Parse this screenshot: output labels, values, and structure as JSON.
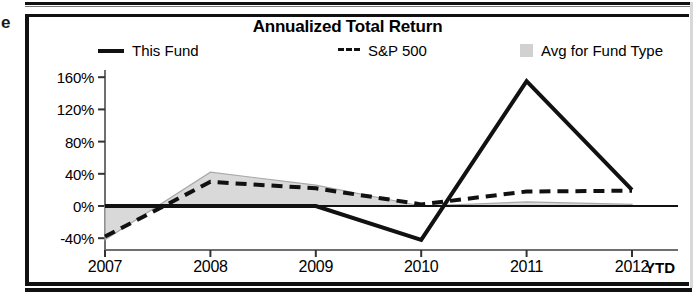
{
  "artifact": {
    "stray_glyph": "e"
  },
  "chart": {
    "title": "Annualized Total Return",
    "legend": [
      {
        "label": "This Fund",
        "marker": "solid-line-swatch",
        "color": "#111111"
      },
      {
        "label": "S&P 500",
        "marker": "dashed-line-swatch",
        "color": "#111111",
        "prefix": "---"
      },
      {
        "label": "Avg for Fund Type",
        "marker": "gray-box-swatch",
        "color": "#c9c9c9"
      }
    ],
    "x_axis_suffix": "YTD"
  },
  "chart_data": {
    "type": "line",
    "title": "Annualized Total Return",
    "xlabel": "",
    "ylabel": "",
    "categories": [
      "2007",
      "2008",
      "2009",
      "2010",
      "2011",
      "2012"
    ],
    "ytick_labels": [
      "160%",
      "120%",
      "80%",
      "40%",
      "0%",
      "-40%"
    ],
    "ytick_values": [
      160,
      120,
      80,
      40,
      0,
      -40
    ],
    "ylim": [
      -48,
      168
    ],
    "grid": false,
    "legend_position": "top",
    "series": [
      {
        "name": "This Fund",
        "style": "solid",
        "color": "#111111",
        "values": [
          0,
          0,
          0,
          -42,
          155,
          20
        ]
      },
      {
        "name": "S&P 500",
        "style": "dashed",
        "color": "#111111",
        "values": [
          -38,
          30,
          22,
          2,
          18,
          19
        ]
      },
      {
        "name": "Avg for Fund Type",
        "style": "band",
        "color": "#c9c9c9",
        "values": [
          -42,
          42,
          26,
          0,
          5,
          2
        ]
      }
    ]
  }
}
